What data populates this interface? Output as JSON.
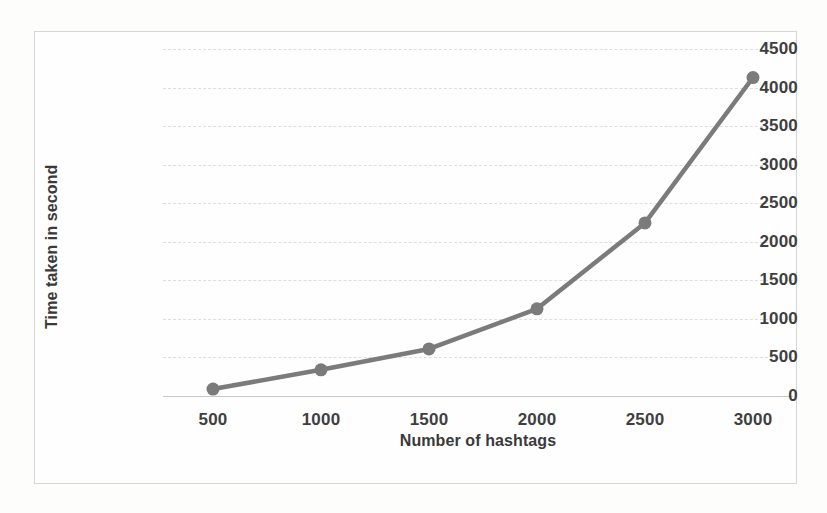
{
  "chart_data": {
    "type": "line",
    "title": "",
    "xlabel": "Number of hashtags",
    "ylabel": "Time taken in second",
    "x": [
      500,
      1000,
      1500,
      2000,
      2500,
      3000
    ],
    "values": [
      90,
      340,
      610,
      1130,
      2245,
      4130
    ],
    "series": [
      {
        "name": "Time taken in second",
        "values": [
          90,
          340,
          610,
          1130,
          2245,
          4130
        ]
      }
    ],
    "xtick_labels": [
      "500",
      "1000",
      "1500",
      "2000",
      "2500",
      "3000"
    ],
    "ytick_labels": [
      "0",
      "500",
      "1000",
      "1500",
      "2000",
      "2500",
      "3000",
      "3500",
      "4000",
      "4500"
    ],
    "ytick_values": [
      0,
      500,
      1000,
      1500,
      2000,
      2500,
      3000,
      3500,
      4000,
      4500
    ],
    "ylim": [
      0,
      4500
    ],
    "xlim": [
      500,
      3000
    ],
    "grid": "horizontal-dashed",
    "legend": "none",
    "marker": "circle",
    "line_color": "#7b7b7b",
    "marker_color": "#7b7b7b",
    "gridline_color": "#dedede",
    "axis_line_color": "#c9c9c9",
    "label_color": "#3f3f3f",
    "frame_color": "#d6d6d6",
    "plot_background": "#fefefe",
    "page_background": "#fdfdfc"
  }
}
